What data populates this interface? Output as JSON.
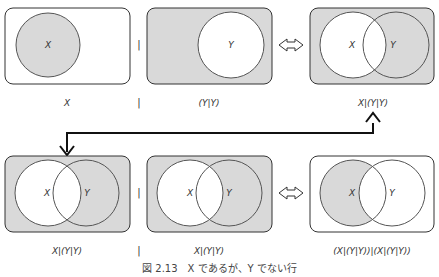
{
  "colors": {
    "fill": "#d9d9d9",
    "stroke": "#333333",
    "background": "#ffffff"
  },
  "top_row": {
    "panel1": {
      "label": "X",
      "circle_label": "X"
    },
    "op1": "|",
    "panel2": {
      "label": "(Y|Y)",
      "circle_label": "Y"
    },
    "equiv": "⇔",
    "panel3": {
      "label": "X|(Y|Y)",
      "circle_x": "X",
      "circle_y": "Y"
    }
  },
  "bottom_row": {
    "panel1": {
      "label": "X|(Y|Y)",
      "circle_x": "X",
      "circle_y": "Y"
    },
    "op1": "|",
    "panel2": {
      "label": "X|(Y|Y)",
      "circle_x": "X",
      "circle_y": "Y"
    },
    "equiv": "⇔",
    "panel3": {
      "label": "(X|(Y|Y))|(X|(Y|Y))",
      "circle_x": "X",
      "circle_y": "Y"
    }
  },
  "caption": "図 2.13　X であるが、Y でない行"
}
